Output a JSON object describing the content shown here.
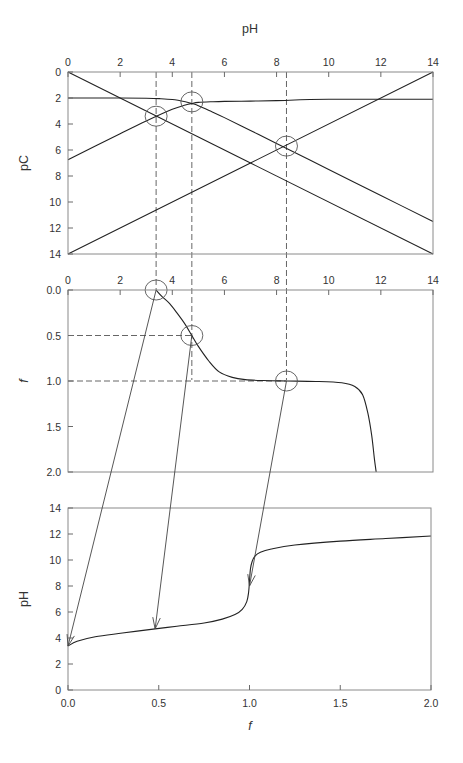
{
  "chart_data": [
    {
      "id": "pC_vs_pH",
      "type": "line",
      "title": "",
      "xlabel": "pH",
      "ylabel": "pC",
      "xlim": [
        0,
        14
      ],
      "ylim": [
        0,
        14
      ],
      "y_inverted": true,
      "x_axis_position": "top",
      "xticks": [
        "0",
        "2",
        "4",
        "6",
        "8",
        "10",
        "12",
        "14"
      ],
      "yticks": [
        "0",
        "2",
        "4",
        "6",
        "8",
        "10",
        "12",
        "14"
      ],
      "grid": false,
      "series": [
        {
          "name": "H+",
          "x": [
            0,
            14
          ],
          "y": [
            0,
            14
          ]
        },
        {
          "name": "OH-",
          "x": [
            0,
            14
          ],
          "y": [
            14,
            0
          ]
        },
        {
          "name": "HA",
          "x": [
            0,
            2,
            3,
            3.5,
            4,
            4.5,
            4.75,
            5,
            5.5,
            6,
            7,
            8,
            10,
            12,
            14
          ],
          "y": [
            2.0,
            2.0,
            2.02,
            2.05,
            2.12,
            2.29,
            2.42,
            2.59,
            3.04,
            3.51,
            4.5,
            5.5,
            7.5,
            9.5,
            11.5
          ]
        },
        {
          "name": "A-",
          "x": [
            0,
            2,
            3,
            4,
            4.5,
            4.75,
            5,
            5.5,
            6,
            7,
            8,
            10,
            14
          ],
          "y": [
            6.75,
            4.75,
            3.77,
            2.87,
            2.54,
            2.42,
            2.34,
            2.29,
            2.26,
            2.24,
            2.2,
            2.1,
            2.1
          ]
        }
      ],
      "annotations": [
        {
          "label": "circle",
          "x": 3.38,
          "y": 3.4
        },
        {
          "label": "circle",
          "x": 4.75,
          "y": 2.3
        },
        {
          "label": "circle",
          "x": 8.38,
          "y": 5.7
        }
      ],
      "guide_lines_x": [
        3.38,
        4.75,
        8.38
      ]
    },
    {
      "id": "f_vs_pH",
      "type": "line",
      "title": "",
      "xlabel": "",
      "ylabel": "f",
      "xlim": [
        0,
        14
      ],
      "ylim": [
        0,
        2
      ],
      "y_inverted": true,
      "x_axis_position": "top",
      "xticks": [
        "0",
        "2",
        "4",
        "6",
        "8",
        "10",
        "12",
        "14"
      ],
      "yticks": [
        "0.0",
        "0.5",
        "1.0",
        "1.5",
        "2.0"
      ],
      "grid": false,
      "series": [
        {
          "name": "f(pH)",
          "x": [
            3.38,
            3.6,
            3.9,
            4.2,
            4.5,
            4.75,
            5.0,
            5.4,
            5.8,
            6.3,
            6.8,
            7.5,
            8.38,
            9.5,
            10.5,
            11.0,
            11.3,
            11.5,
            11.65,
            11.75,
            11.82
          ],
          "y": [
            0.0,
            0.07,
            0.15,
            0.26,
            0.38,
            0.5,
            0.62,
            0.78,
            0.9,
            0.96,
            0.985,
            0.995,
            1.0,
            1.005,
            1.02,
            1.06,
            1.15,
            1.35,
            1.6,
            1.85,
            2.0
          ]
        }
      ],
      "annotations": [
        {
          "label": "circle",
          "x": 3.38,
          "y": 0.0
        },
        {
          "label": "circle",
          "x": 4.75,
          "y": 0.5
        },
        {
          "label": "circle",
          "x": 8.38,
          "y": 1.0
        }
      ],
      "guide_lines_y": [
        0.5,
        1.0
      ]
    },
    {
      "id": "pH_vs_f",
      "type": "line",
      "title": "",
      "xlabel": "f",
      "ylabel": "pH",
      "xlim": [
        0,
        2
      ],
      "ylim": [
        0,
        14
      ],
      "xticks": [
        "0.0",
        "0.5",
        "1.0",
        "1.5",
        "2.0"
      ],
      "yticks": [
        "0",
        "2",
        "4",
        "6",
        "8",
        "10",
        "12",
        "14"
      ],
      "grid": false,
      "series": [
        {
          "name": "titration curve",
          "x": [
            0.0,
            0.05,
            0.15,
            0.3,
            0.48,
            0.6,
            0.75,
            0.85,
            0.92,
            0.96,
            0.985,
            0.995,
            1.0,
            1.005,
            1.015,
            1.03,
            1.06,
            1.12,
            1.25,
            1.5,
            1.75,
            2.0
          ],
          "y": [
            3.38,
            3.75,
            4.1,
            4.38,
            4.7,
            4.9,
            5.15,
            5.45,
            5.8,
            6.2,
            6.8,
            7.5,
            8.38,
            9.3,
            9.9,
            10.3,
            10.6,
            10.85,
            11.15,
            11.45,
            11.65,
            11.85
          ]
        }
      ],
      "arrows": [
        {
          "from_panel": "f_vs_pH",
          "from": [
            3.38,
            0.0
          ],
          "to": [
            0.0,
            3.38
          ]
        },
        {
          "from_panel": "f_vs_pH",
          "from": [
            4.75,
            0.5
          ],
          "to": [
            0.48,
            4.7
          ]
        },
        {
          "from_panel": "f_vs_pH",
          "from": [
            8.38,
            1.0
          ],
          "to": [
            1.0,
            8.0
          ]
        }
      ]
    }
  ]
}
